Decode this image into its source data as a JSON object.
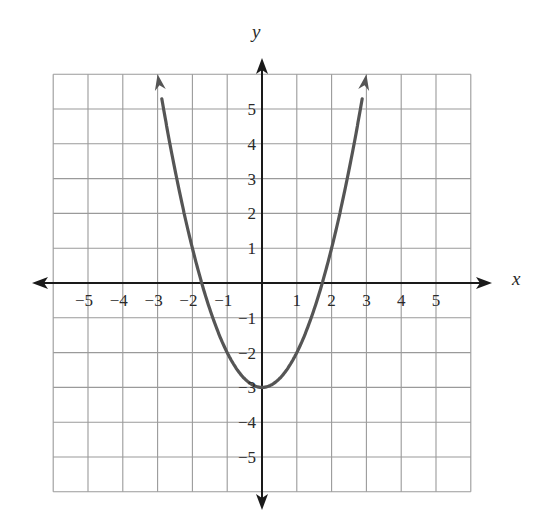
{
  "chart_data": {
    "type": "line",
    "title": "",
    "xlabel": "x",
    "ylabel": "y",
    "function": "y = x^2 - 3",
    "xlim": [
      -6,
      6
    ],
    "ylim": [
      -6,
      6
    ],
    "grid": true,
    "x_ticks": [
      -5,
      -4,
      -3,
      -2,
      -1,
      1,
      2,
      3,
      4,
      5
    ],
    "y_ticks": [
      5,
      4,
      3,
      2,
      1,
      -1,
      -2,
      -3,
      -4,
      -5
    ],
    "x_tick_labels": [
      "−5",
      "−4",
      "−3",
      "−2",
      "−1",
      "1",
      "2",
      "3",
      "4",
      "5"
    ],
    "y_tick_labels": [
      "5",
      "4",
      "3",
      "2",
      "1",
      "−1",
      "−2",
      "−3",
      "−4",
      "−5"
    ],
    "series": [
      {
        "name": "parabola",
        "color": "#555555",
        "x": [
          -3,
          -2.5,
          -2,
          -1.5,
          -1,
          -0.5,
          0,
          0.5,
          1,
          1.5,
          2,
          2.5,
          3
        ],
        "y": [
          6,
          3.25,
          1,
          -0.75,
          -2,
          -2.75,
          -3,
          -2.75,
          -2,
          -0.75,
          1,
          3.25,
          6
        ],
        "end_arrows": true
      }
    ],
    "vertex": [
      0,
      -3
    ],
    "x_intercepts": [
      -1.73,
      1.73
    ],
    "legend": null
  },
  "colors": {
    "grid": "#9a9a9a",
    "axis": "#1a1a1a",
    "curve": "#555555"
  }
}
